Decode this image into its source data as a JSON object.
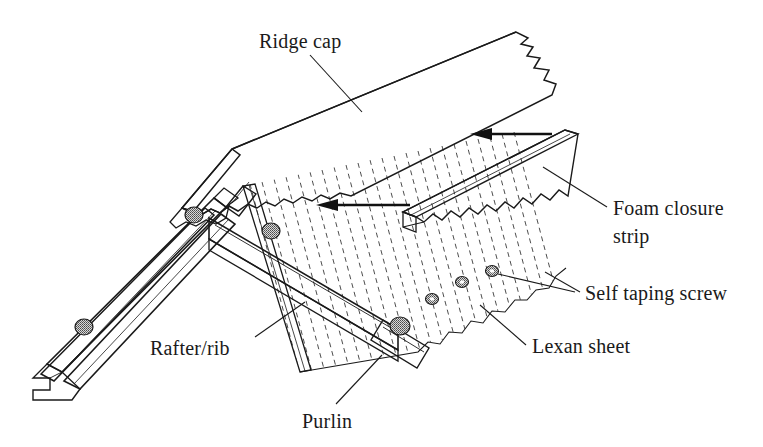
{
  "figure": {
    "background_color": "#ffffff",
    "line_color": "#1a1a1a",
    "width": 763,
    "height": 447
  },
  "labels": {
    "ridge_cap": "Ridge cap",
    "foam_closure_line1": "Foam closure",
    "foam_closure_line2": "strip",
    "self_taping_screw": "Self taping screw",
    "lexan_sheet": "Lexan sheet",
    "rafter_rib": "Rafter/rib",
    "purlin": "Purlin"
  },
  "parts": {
    "ridge_cap": {
      "name": "Ridge cap",
      "fill_color": "#a9a9a9",
      "description": "bent metal ridge cap panel with torn right edge and scalloped left end"
    },
    "foam_closure_strip": {
      "name": "Foam closure strip",
      "fill_color": "#e8e8e8",
      "description": "long bar with wavy scalloped underside matching the corrugation"
    },
    "lexan_sheet": {
      "name": "Lexan sheet",
      "fill_color": "#ffffff",
      "description": "corrugated polycarbonate panel drawn with dashed rib lines and a torn lower-right edge"
    },
    "rafter_rib": {
      "name": "Rafter/rib",
      "fill_color": "#ffffff",
      "description": "extruded rafter profile running down to the lower left with a notched end"
    },
    "purlin": {
      "name": "Purlin",
      "fill_color": "#ffffff",
      "description": "horizontal member running down to the lower right"
    },
    "self_taping_screw": {
      "name": "Self taping screw",
      "fill_color": "#8c8c8c",
      "count_visible": 7
    }
  },
  "arrows": [
    {
      "name": "upper-assembly-arrow",
      "direction": "left",
      "meaning": "slide foam closure strip toward ridge"
    },
    {
      "name": "lower-assembly-arrow",
      "direction": "left",
      "meaning": "slide ridge cap toward ridge"
    }
  ]
}
